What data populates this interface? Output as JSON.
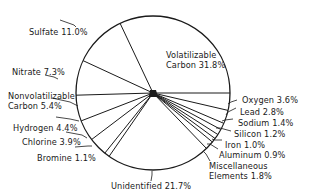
{
  "chart_data": {
    "type": "pie",
    "title": "",
    "start_angle_deg": 0,
    "direction": "clockwise",
    "slices": [
      {
        "label": "Oxygen",
        "value": 3.6
      },
      {
        "label": "Lead",
        "value": 2.8
      },
      {
        "label": "Sodium",
        "value": 1.4
      },
      {
        "label": "Silicon",
        "value": 1.2
      },
      {
        "label": "Iron",
        "value": 1.0
      },
      {
        "label": "Aluminum",
        "value": 0.9
      },
      {
        "label": "Miscellaneous Elements",
        "value": 1.8
      },
      {
        "label": "Unidentified",
        "value": 21.7
      },
      {
        "label": "Bromine",
        "value": 1.1
      },
      {
        "label": "Chlorine",
        "value": 3.9
      },
      {
        "label": "Hydrogen",
        "value": 4.4
      },
      {
        "label": "Nonvolatilizable Carbon",
        "value": 5.4
      },
      {
        "label": "Nitrate",
        "value": 7.3
      },
      {
        "label": "Sulfate",
        "value": 11.0
      },
      {
        "label": "Volatilizable Carbon",
        "value": 31.8
      }
    ],
    "unit": "%"
  },
  "labels": {
    "volatilizable_1": "Volatilizable",
    "volatilizable_2": "Carbon 31.8%",
    "sulfate": "Sulfate 11.0%",
    "nitrate": "Nitrate 7.3%",
    "nonvol_1": "Nonvolatilizable",
    "nonvol_2": "Carbon 5.4%",
    "hydrogen": "Hydrogen 4.4%",
    "chlorine": "Chlorine 3.9%",
    "bromine": "Bromine 1.1%",
    "unidentified": "Unidentified 21.7%",
    "oxygen": "Oxygen 3.6%",
    "lead": "Lead 2.8%",
    "sodium": "Sodium 1.4%",
    "silicon": "Silicon 1.2%",
    "iron": "Iron 1.0%",
    "aluminum": "Aluminum 0.9%",
    "misc_1": "Miscellaneous",
    "misc_2": "Elements 1.8%"
  }
}
